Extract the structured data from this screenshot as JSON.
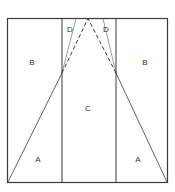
{
  "diagram": {
    "line_color": "#3a3a3a",
    "labels": {
      "left_upper": "B",
      "right_upper": "B",
      "center": "C",
      "left_lower": "A",
      "right_lower": "A",
      "top_left": "D",
      "top_right": "D"
    }
  }
}
